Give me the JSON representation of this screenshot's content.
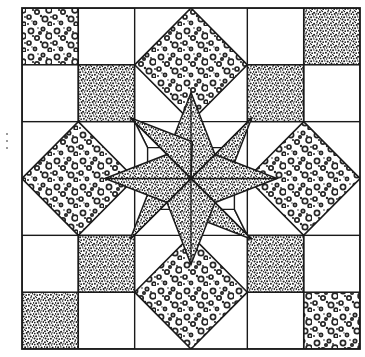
{
  "document": {
    "kind": "quilt-block-line-drawing",
    "title": "Eight-Pointed Blazing Star Quilt Block",
    "background_color": "#ffffff",
    "ink_color": "#1a1a1a",
    "line_width": 1.4,
    "canvas": {
      "width": 365,
      "height": 357
    }
  },
  "block": {
    "name": "Blazing Star / Dutch Rose",
    "frame": {
      "x": 22,
      "y": 8,
      "width": 338,
      "height": 341
    },
    "grid_divisions": 6,
    "grid_x": [
      22,
      78.33,
      134.67,
      191,
      247.33,
      303.67,
      360
    ],
    "grid_y": [
      8,
      64.83,
      121.67,
      178.5,
      235.33,
      292.17,
      349
    ],
    "center": {
      "x": 191,
      "y": 178.5
    }
  },
  "fabrics": {
    "light": {
      "key": "light-bubbly",
      "label": "Light print (bubbly / floral)",
      "base_color": "#ffffff",
      "dot_color": "#262626",
      "density": "sparse-large"
    },
    "dark": {
      "key": "dark-stipple",
      "label": "Dark print (fine stipple)",
      "base_color": "#ffffff",
      "dot_color": "#1c1c1c",
      "density": "dense-fine"
    },
    "plain": {
      "key": "plain-white",
      "label": "Plain background (white)",
      "base_color": "#ffffff",
      "dot_color": "none",
      "density": "none"
    }
  },
  "pieces": {
    "corner_squares": [
      {
        "name": "corner-square-top-left",
        "fabric": "light",
        "x": 22,
        "y": 8,
        "w": 56.33,
        "h": 56.83
      },
      {
        "name": "corner-square-top-right",
        "fabric": "dark",
        "x": 303.67,
        "y": 8,
        "w": 56.33,
        "h": 56.83
      },
      {
        "name": "corner-square-bottom-left",
        "fabric": "dark",
        "x": 22,
        "y": 292.17,
        "w": 56.33,
        "h": 56.83
      },
      {
        "name": "corner-square-bottom-right",
        "fabric": "light",
        "x": 303.67,
        "y": 292.17,
        "w": 56.33,
        "h": 56.83
      }
    ],
    "plain_corner_fill": [
      {
        "name": "plain-square-top-left-inner",
        "x": 78.33,
        "y": 8,
        "w": 56.33,
        "h": 56.83
      },
      {
        "name": "plain-square-top-left-under",
        "x": 22,
        "y": 64.83,
        "w": 56.33,
        "h": 56.83
      },
      {
        "name": "plain-square-top-right-inner",
        "x": 247.33,
        "y": 8,
        "w": 56.33,
        "h": 56.83
      },
      {
        "name": "plain-square-top-right-under",
        "x": 303.67,
        "y": 64.83,
        "w": 56.33,
        "h": 56.83
      },
      {
        "name": "plain-square-bottom-left-inner",
        "x": 78.33,
        "y": 292.17,
        "w": 56.33,
        "h": 56.83
      },
      {
        "name": "plain-square-bottom-left-over",
        "x": 22,
        "y": 235.33,
        "w": 56.33,
        "h": 56.83
      },
      {
        "name": "plain-square-bottom-right-inner",
        "x": 247.33,
        "y": 292.17,
        "w": 56.33,
        "h": 56.83
      },
      {
        "name": "plain-square-bottom-right-over",
        "x": 303.67,
        "y": 235.33,
        "w": 56.33,
        "h": 56.83
      }
    ],
    "dark_squares": [
      {
        "name": "dark-square-upper-left",
        "fabric": "dark",
        "x": 78.33,
        "y": 64.83,
        "w": 56.33,
        "h": 56.83
      },
      {
        "name": "dark-square-upper-right",
        "fabric": "dark",
        "x": 247.33,
        "y": 64.83,
        "w": 56.33,
        "h": 56.83
      },
      {
        "name": "dark-square-lower-left",
        "fabric": "dark",
        "x": 78.33,
        "y": 235.33,
        "w": 56.33,
        "h": 56.83
      },
      {
        "name": "dark-square-lower-right",
        "fabric": "dark",
        "x": 247.33,
        "y": 235.33,
        "w": 56.33,
        "h": 56.83
      }
    ],
    "edge_diamonds": [
      {
        "name": "edge-diamond-top",
        "fabric": "light",
        "cx": 191,
        "cy": 64.83,
        "rx": 56.33,
        "ry": 56.83
      },
      {
        "name": "edge-diamond-bottom",
        "fabric": "light",
        "cx": 191,
        "cy": 292.17,
        "rx": 56.33,
        "ry": 56.83
      },
      {
        "name": "edge-diamond-left",
        "fabric": "light",
        "cx": 78.33,
        "cy": 178.5,
        "rx": 56.33,
        "ry": 56.83
      },
      {
        "name": "edge-diamond-right",
        "fabric": "light",
        "cx": 303.67,
        "cy": 178.5,
        "rx": 56.33,
        "ry": 56.83
      }
    ],
    "star": {
      "name": "eight-pointed-star",
      "point_count": 8,
      "fabric_all_points": "dark",
      "tip_radius": 86,
      "waist_radius": 34,
      "waist_offset_deg": 22.5,
      "points": [
        {
          "name": "star-point-n",
          "angle_deg": 270,
          "fabric": "dark"
        },
        {
          "name": "star-point-ne",
          "angle_deg": 315,
          "fabric": "dark"
        },
        {
          "name": "star-point-e",
          "angle_deg": 0,
          "fabric": "dark"
        },
        {
          "name": "star-point-se",
          "angle_deg": 45,
          "fabric": "dark"
        },
        {
          "name": "star-point-s",
          "angle_deg": 90,
          "fabric": "dark"
        },
        {
          "name": "star-point-sw",
          "angle_deg": 135,
          "fabric": "dark"
        },
        {
          "name": "star-point-w",
          "angle_deg": 180,
          "fabric": "dark"
        },
        {
          "name": "star-point-nw",
          "angle_deg": 225,
          "fabric": "dark"
        }
      ]
    }
  },
  "scan_artifacts": [
    {
      "name": "scan-speck-left-upper",
      "x": 6,
      "y": 133
    },
    {
      "name": "scan-speck-left-mid",
      "x": 6,
      "y": 140
    },
    {
      "name": "scan-speck-left-lower",
      "x": 6,
      "y": 147
    }
  ]
}
